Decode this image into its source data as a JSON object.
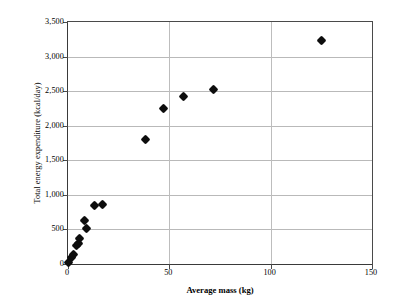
{
  "chart_data": {
    "type": "scatter",
    "title": "",
    "xlabel": "Average mass (kg)",
    "ylabel": "Total energy expenditure (kcal/day)",
    "xlim": [
      0,
      150
    ],
    "ylim": [
      0,
      3500
    ],
    "xticks": [
      "0",
      "50",
      "100",
      "150"
    ],
    "xtick_values": [
      0,
      50,
      100,
      150
    ],
    "yticks": [
      "0",
      "500",
      "1,000",
      "1,500",
      "2,000",
      "2,500",
      "3,000",
      "3,500"
    ],
    "ytick_values": [
      0,
      500,
      1000,
      1500,
      2000,
      2500,
      3000,
      3500
    ],
    "grid": "horizontal-and-major-vertical",
    "legend": "none",
    "marker": "filled-diamond",
    "marker_color": "#0d0d0d",
    "series": [
      {
        "name": "Total energy expenditure vs average mass",
        "points": [
          {
            "x": 0.3,
            "y": 15
          },
          {
            "x": 1.5,
            "y": 95
          },
          {
            "x": 2.5,
            "y": 140
          },
          {
            "x": 4.0,
            "y": 270
          },
          {
            "x": 5.0,
            "y": 290
          },
          {
            "x": 5.5,
            "y": 375
          },
          {
            "x": 8.0,
            "y": 625
          },
          {
            "x": 9.0,
            "y": 520
          },
          {
            "x": 13.0,
            "y": 840
          },
          {
            "x": 17.0,
            "y": 860
          },
          {
            "x": 38.0,
            "y": 1805
          },
          {
            "x": 47.0,
            "y": 2250
          },
          {
            "x": 57.0,
            "y": 2420
          },
          {
            "x": 72.0,
            "y": 2530
          },
          {
            "x": 125.0,
            "y": 3230
          }
        ]
      }
    ]
  }
}
